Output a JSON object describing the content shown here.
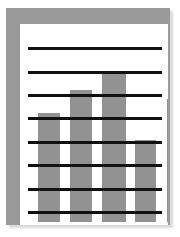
{
  "icon": {
    "name": "bar-chart-framed-icon",
    "title": "Bar chart"
  },
  "colors": {
    "frame": "#9a9a9a",
    "canvas": "#ffffff",
    "bar": "#929292",
    "gridline": "#111111",
    "shadow": "#d9d9d9",
    "page_background": "#ffffff"
  },
  "chart_data": {
    "type": "bar",
    "title": "",
    "subtitle": "",
    "xlabel": "",
    "ylabel": "",
    "categories": [
      "1",
      "2",
      "3",
      "4",
      "5"
    ],
    "values": [
      4.5,
      6.0,
      7.0,
      3.0,
      5.5
    ],
    "ylim": [
      0,
      9
    ],
    "xlim": [
      0,
      5
    ],
    "grid": true,
    "gridline_count": 9,
    "gridline_values": [
      9,
      8,
      7,
      6,
      5,
      4,
      3,
      2,
      1
    ],
    "legend": null,
    "legend_position": "none",
    "tick_labels_visible": false,
    "annotations": [],
    "series": [
      {
        "name": "series-1",
        "values": [
          4.5,
          6.0,
          7.0,
          3.0,
          5.5
        ]
      }
    ],
    "bar_geometry": [
      {
        "category": "1",
        "left": 18,
        "width": 22,
        "top": 89
      },
      {
        "category": "2",
        "left": 50,
        "width": 22,
        "top": 66
      },
      {
        "category": "3",
        "left": 82,
        "width": 24,
        "top": 47
      },
      {
        "category": "4",
        "left": 115,
        "width": 21,
        "top": 116
      },
      {
        "category": "5",
        "left": 147,
        "width": 22,
        "top": 75
      }
    ],
    "gridline_geometry": [
      {
        "index": 0,
        "top": 23
      },
      {
        "index": 1,
        "top": 47
      },
      {
        "index": 2,
        "top": 70
      },
      {
        "index": 3,
        "top": 93
      },
      {
        "index": 4,
        "top": 117
      },
      {
        "index": 5,
        "top": 140
      },
      {
        "index": 6,
        "top": 164
      },
      {
        "index": 7,
        "top": 187
      },
      {
        "index": 8,
        "top": 211
      }
    ]
  }
}
